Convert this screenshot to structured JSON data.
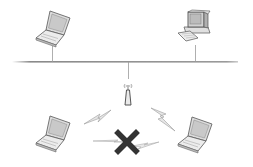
{
  "diagram": {
    "type": "network-topology",
    "colors": {
      "background": "#ffffff",
      "line": "#9a9a9a",
      "device_outline": "#6e6e6e",
      "device_fill": "#e8e8e8",
      "screen_fill": "#cfcfcf",
      "bolt_fill": "#e6e6e6",
      "cross": "#333333"
    },
    "nodes": [
      {
        "id": "laptop-wired",
        "kind": "laptop",
        "x": 50,
        "y": 30
      },
      {
        "id": "desktop-wired",
        "kind": "desktop",
        "x": 196,
        "y": 30
      },
      {
        "id": "access-point",
        "kind": "wireless-access-point",
        "x": 128,
        "y": 95
      },
      {
        "id": "laptop-wireless-left",
        "kind": "laptop",
        "x": 50,
        "y": 135
      },
      {
        "id": "laptop-wireless-right",
        "kind": "laptop",
        "x": 196,
        "y": 135
      }
    ],
    "links": [
      {
        "from": "laptop-wired",
        "to": "bus",
        "type": "wired"
      },
      {
        "from": "desktop-wired",
        "to": "bus",
        "type": "wired"
      },
      {
        "from": "access-point",
        "to": "bus",
        "type": "wired"
      },
      {
        "from": "access-point",
        "to": "laptop-wireless-left",
        "type": "wireless"
      },
      {
        "from": "access-point",
        "to": "laptop-wireless-right",
        "type": "wireless"
      },
      {
        "from": "laptop-wireless-left",
        "to": "laptop-wireless-right",
        "type": "wireless",
        "status": "blocked"
      }
    ]
  }
}
